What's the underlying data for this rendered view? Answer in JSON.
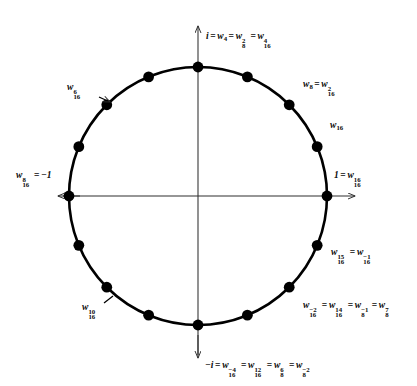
{
  "figure": {
    "type": "unit-circle-diagram",
    "center": {
      "x": 198,
      "y": 196
    },
    "radius": 129,
    "num_points": 16,
    "colors": {
      "circle": "#000000",
      "axis": "#2b2b2b",
      "point": "#000000",
      "text": "#0b0b0b",
      "background": "#ffffff"
    },
    "axes": {
      "horizontal": {
        "x1": 55,
        "y1": 196,
        "x2": 362,
        "y2": 196,
        "arrow_right": true,
        "arrow_left": true
      },
      "vertical": {
        "x1": 198,
        "y1": 22,
        "x2": 198,
        "y2": 362,
        "arrow_up": true,
        "arrow_down": true
      }
    },
    "points_deg": [
      0,
      22.5,
      45,
      67.5,
      90,
      112.5,
      135,
      157.5,
      180,
      202.5,
      225,
      247.5,
      270,
      292.5,
      315,
      337.5
    ]
  },
  "labels": {
    "top": {
      "name": "label-i-top",
      "text": "i = w4 = w8^2 = w16^4",
      "angle_deg": 90,
      "x": 206,
      "y": 31
    },
    "upper_right_w8": {
      "name": "label-w8",
      "text": "w8 = w16^2",
      "angle_deg": 45,
      "x": 303,
      "y": 79
    },
    "right_w16": {
      "name": "label-w16",
      "text": "w16",
      "angle_deg": 22.5,
      "x": 330,
      "y": 120
    },
    "right_one": {
      "name": "label-one-right",
      "text": "1 = w16^16",
      "angle_deg": 0,
      "x": 334,
      "y": 170
    },
    "lower_right_w15": {
      "name": "label-w16-15",
      "text": "w16^15 = w16^-1",
      "angle_deg": -22.5,
      "x": 331,
      "y": 247
    },
    "lower_right_long": {
      "name": "label-w16-minus2",
      "text": "w16^-2 = w16^14 = w8^-1 = w8^7",
      "angle_deg": -45,
      "x": 303,
      "y": 300
    },
    "bottom": {
      "name": "label-minus-i-bottom",
      "text": "-i = w16^-4 = w16^12 = w8^6 = w8^-2",
      "angle_deg": -90,
      "x": 205,
      "y": 360
    },
    "lower_left_w10": {
      "name": "label-w16-10",
      "text": "w16^10",
      "angle_deg": 225,
      "x": 82,
      "y": 302
    },
    "left_minus_one": {
      "name": "label-minus-one-left",
      "text": "w16^8 = -1",
      "angle_deg": 180,
      "x": 16,
      "y": 170
    },
    "upper_left_w6": {
      "name": "label-w16-6",
      "text": "w16^6",
      "angle_deg": 135,
      "x": 67,
      "y": 82
    }
  },
  "symbols": {
    "w": "w",
    "i": "i",
    "one": "1",
    "minus_one": "-1",
    "minus_i": "-i",
    "eq": "=",
    "sub_4": "4",
    "sub_8": "8",
    "sub_16": "16",
    "sup_2": "2",
    "sup_4": "4",
    "sup_6": "6",
    "sup_7": "7",
    "sup_8": "8",
    "sup_10": "10",
    "sup_12": "12",
    "sup_14": "14",
    "sup_15": "15",
    "sup_16": "16",
    "sup_m1": "−1",
    "sup_m2": "−2",
    "sup_m4": "−4"
  }
}
